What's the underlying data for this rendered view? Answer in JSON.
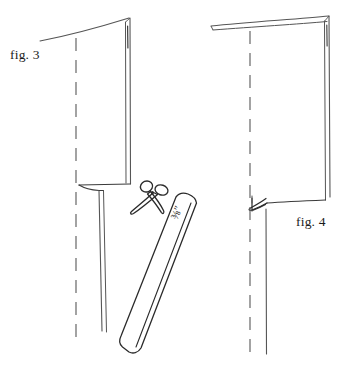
{
  "illustration": {
    "kind": "line-drawing",
    "subject": "sewing hem folding instructions",
    "width": 360,
    "height": 378,
    "background_color": "#ffffff",
    "ink_color": "#1a1a1a",
    "line_color": "#555555"
  },
  "labels": {
    "fig3": "fig. 3",
    "fig4": "fig. 4"
  },
  "figures": [
    {
      "id": "fig-3",
      "label": "fig. 3",
      "caption_position": "left",
      "elements": [
        "fabric-panel",
        "folded-right-edge",
        "dashed-fold-line",
        "cut-step-notch",
        "scissors",
        "measuring-strip"
      ]
    },
    {
      "id": "fig-4",
      "label": "fig. 4",
      "caption_position": "bottom-right",
      "elements": [
        "fabric-panel",
        "folded-top-edge",
        "folded-right-edge",
        "dashed-fold-line",
        "curled-hem-corner"
      ]
    }
  ],
  "tools": {
    "scissors": {
      "name": "scissors",
      "position": "center",
      "orientation": "blades-down-left"
    },
    "measuring_strip": {
      "name": "measuring-gauge-strip",
      "marking": "⅜\"",
      "marking_plain": "3/8 inch",
      "orientation": "diagonal-down-left"
    }
  },
  "annotations": {
    "strip_measurement": "⅜\""
  }
}
